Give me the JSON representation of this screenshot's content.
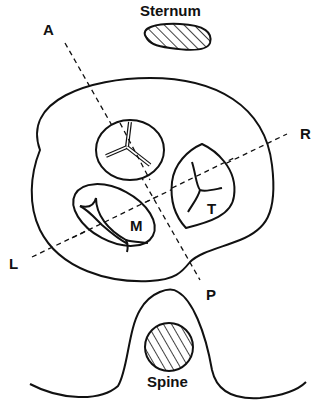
{
  "diagram": {
    "labels": {
      "sternum": "Sternum",
      "spine": "Spine",
      "axis_anterior": "A",
      "axis_posterior": "P",
      "axis_left": "L",
      "axis_right": "R",
      "mitral": "M",
      "tricuspid": "T"
    },
    "colors": {
      "stroke": "#111111",
      "background": "#ffffff"
    }
  }
}
